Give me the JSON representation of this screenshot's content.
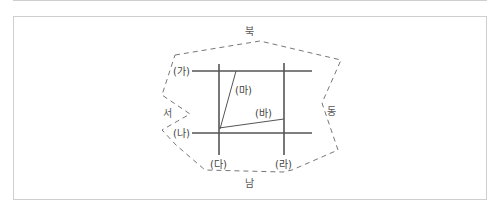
{
  "diagram": {
    "directions": {
      "north": "북",
      "south": "남",
      "east": "동",
      "west": "서"
    },
    "lines": {
      "ga": "(가)",
      "na": "(나)",
      "da": "(다)",
      "ra": "(라)",
      "ma": "(마)",
      "ba": "(바)"
    },
    "colors": {
      "line": "#555555",
      "boundary": "#777777",
      "border": "#cfcfcf"
    }
  }
}
